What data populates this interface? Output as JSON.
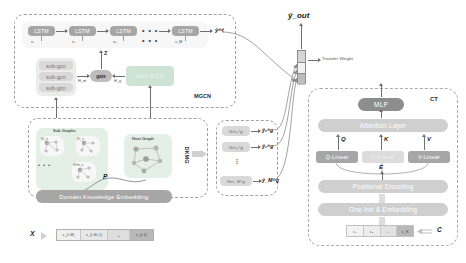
{
  "figure": {
    "output_label": "ŷ_out",
    "transfer_weight_label": "Transfer Weight"
  },
  "mgcn": {
    "title": "MGCN",
    "lstm_cells": [
      {
        "label": "LSTM",
        "input": "x₁"
      },
      {
        "label": "LSTM",
        "input": "x₂"
      },
      {
        "label": "LSTM",
        "input": "x₃"
      },
      {
        "label": "LSTM",
        "input": "x_M"
      }
    ],
    "lstm_ellipsis": "• • •",
    "lstm_ellipsis_lower": "• • •",
    "lstm_output": "ŷ^t",
    "sub_gcn_blocks": [
      "sub-gcn",
      "sub-gcn",
      "sub-gcn"
    ],
    "gate_label": "gate",
    "hier_gcn_label": "Hier-GCN",
    "z_label": "Z",
    "hm_label": "H_m",
    "hg_label": "H_g"
  },
  "dkmg": {
    "title": "DKMG",
    "sub_graphs_title": "Sub Graphs",
    "sub_graph_items": [
      "G¹_s",
      "G²_s",
      "G^m_s"
    ],
    "sub_graph_ellipsis": "• • •",
    "host_graph_title": "Host Graph",
    "p_label": "P",
    "embedding_label": "Domain Knowledge Embedding"
  },
  "nets": {
    "rows": [
      {
        "net": "Net₁^g",
        "out": "ŷ₁^g"
      },
      {
        "net": "Net₂^g",
        "out": "ŷ₂^g"
      },
      {
        "net": "Net_M^g",
        "out": "ŷ_M^g"
      }
    ],
    "vdots": "⋮"
  },
  "ct": {
    "title": "CT",
    "mlp_label": "MLP",
    "attention_label": "Attention Layer",
    "linears": [
      {
        "block": "Q-Linear",
        "symbol": "Q"
      },
      {
        "block": "K-Linear",
        "symbol": "K"
      },
      {
        "block": "V-Linear",
        "symbol": "V"
      }
    ],
    "e_label": "E",
    "positional_label": "Positional Encoding",
    "onehot_label": "One-hot & Embedding",
    "tokens": [
      "c₁",
      "c₂",
      "...",
      "c_K"
    ],
    "c_label": "C"
  },
  "input": {
    "x_label": "X",
    "cells": [
      "x_{t-M}",
      "x_{t-M+1}",
      "→",
      "x_{t-1}"
    ]
  },
  "colors": {
    "block_gray": "#a6a6a6",
    "block_dark": "#8d8d8d",
    "block_light": "#d9d9d9",
    "panel_green": "#e4efe6",
    "frame_dash": "#9aa0a6"
  }
}
